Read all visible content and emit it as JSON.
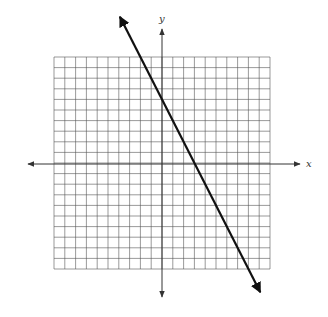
{
  "chart_data": {
    "type": "line",
    "title": "",
    "xlabel": "x",
    "ylabel": "y",
    "xlim": [
      -10,
      10
    ],
    "ylim": [
      -10,
      10
    ],
    "grid": true,
    "grid_step": 1,
    "tick_labels": false,
    "legend": null,
    "series": [
      {
        "name": "line",
        "equation": "y = -2x + 6",
        "slope": -2,
        "intercept": 6,
        "x": [
          -3.9,
          9.1
        ],
        "y": [
          13.8,
          -12.2
        ],
        "arrows_both_ends": true
      }
    ],
    "points_on_line": [
      {
        "x": 0,
        "y": 6
      },
      {
        "x": 3,
        "y": 0
      }
    ]
  },
  "labels": {
    "x_axis": "x",
    "y_axis": "y"
  },
  "colors": {
    "grid": "#555555",
    "axes": "#333333",
    "line": "#111111",
    "background": "#ffffff"
  }
}
